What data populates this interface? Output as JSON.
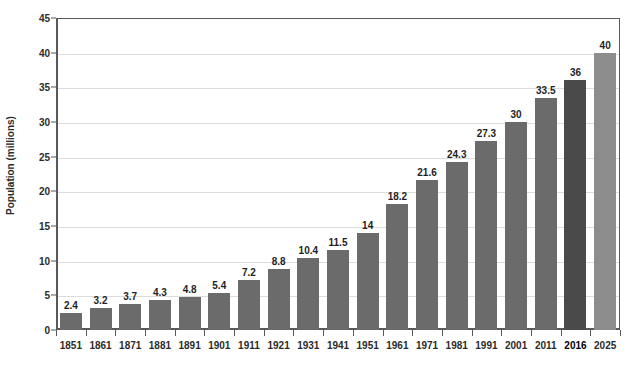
{
  "chart_data": {
    "type": "bar",
    "title": "",
    "subtitle": "",
    "xlabel": "",
    "ylabel": "Population (millions)",
    "ylim": [
      0,
      45
    ],
    "ytick_step": 5,
    "yticks": [
      0,
      5,
      10,
      15,
      20,
      25,
      30,
      35,
      40,
      45
    ],
    "grid": true,
    "legend": "none",
    "categories": [
      "1851",
      "1861",
      "1871",
      "1881",
      "1891",
      "1901",
      "1911",
      "1921",
      "1931",
      "1941",
      "1951",
      "1961",
      "1971",
      "1981",
      "1991",
      "2001",
      "2011",
      "2016",
      "2025"
    ],
    "values": [
      2.4,
      3.2,
      3.7,
      4.3,
      4.8,
      5.4,
      7.2,
      8.8,
      10.4,
      11.5,
      14,
      18.2,
      21.6,
      24.3,
      27.3,
      30,
      33.5,
      36,
      40
    ],
    "value_labels": [
      "2.4",
      "3.2",
      "3.7",
      "4.3",
      "4.8",
      "5.4",
      "7.2",
      "8.8",
      "10.4",
      "11.5",
      "14",
      "18.2",
      "21.6",
      "24.3",
      "27.3",
      "30",
      "33.5",
      "36",
      "40"
    ],
    "bar_styles": [
      "normal",
      "normal",
      "normal",
      "normal",
      "normal",
      "normal",
      "normal",
      "normal",
      "normal",
      "normal",
      "normal",
      "normal",
      "normal",
      "normal",
      "normal",
      "normal",
      "normal",
      "accent-dark",
      "accent-light"
    ],
    "emphasized_categories": [
      "2016"
    ],
    "colors": {
      "bar_normal": "#6b6b6b",
      "bar_accent_dark": "#4a4a4a",
      "bar_accent_light": "#8d8d8d",
      "axis": "#58595b",
      "gridline": "#dcdcdc",
      "text": "#2b2b2b",
      "background": "#ffffff"
    }
  }
}
